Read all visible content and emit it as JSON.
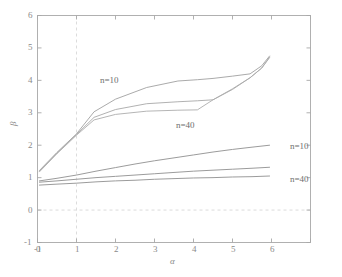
{
  "chart_data": {
    "type": "line",
    "title": "",
    "subtitle": "",
    "xlabel": "α",
    "ylabel": "β",
    "xlim": [
      -1,
      6
    ],
    "ylim": [
      -1,
      6
    ],
    "xticks": [
      -1,
      0,
      1,
      2,
      3,
      4,
      5,
      6
    ],
    "xtick_labels": [
      "-1",
      "0",
      "1",
      "2",
      "3",
      "4",
      "5",
      "6"
    ],
    "yticks": [
      -1,
      0,
      1,
      2,
      3,
      4,
      5,
      6
    ],
    "ytick_labels": [
      "-1",
      "0",
      "1",
      "2",
      "3",
      "4",
      "5",
      "6"
    ],
    "grid": false,
    "legend_position": "inline-annotations",
    "reference_lines": [
      {
        "name": "vertical-zero",
        "axis": "x",
        "value": 0,
        "style": "dashed",
        "color": "#d8d8d8"
      },
      {
        "name": "horizontal-zero",
        "axis": "y",
        "value": 0,
        "style": "dashed",
        "color": "#d8d8d8"
      }
    ],
    "annotations": [
      {
        "text": "n=10",
        "x": 0.6,
        "y": 3.85,
        "group": "upper"
      },
      {
        "text": "n=40",
        "x": 2.55,
        "y": 2.72,
        "group": "upper"
      },
      {
        "text": "n=10",
        "x": 5.2,
        "y": 2.02,
        "group": "lower"
      },
      {
        "text": "n=40",
        "x": 5.2,
        "y": 1.05,
        "group": "lower"
      }
    ],
    "series": [
      {
        "name": "upper-n10",
        "label": "n=10",
        "group": "upper",
        "color": "#a0a0a0",
        "x": [
          -0.95,
          -0.5,
          0.0,
          0.45,
          1.0,
          1.8,
          2.6,
          3.1,
          3.5,
          4.0,
          4.45,
          4.75,
          4.95
        ],
        "y": [
          1.22,
          1.78,
          2.35,
          3.03,
          3.42,
          3.78,
          3.98,
          4.02,
          4.06,
          4.13,
          4.2,
          4.45,
          4.75
        ]
      },
      {
        "name": "upper-n20",
        "label": "n=20",
        "group": "upper",
        "color": "#a8a8a8",
        "x": [
          -0.95,
          -0.5,
          0.0,
          0.45,
          1.0,
          1.8,
          2.6,
          3.1,
          3.5,
          4.0,
          4.45,
          4.75,
          4.95
        ],
        "y": [
          1.2,
          1.76,
          2.33,
          2.86,
          3.1,
          3.28,
          3.34,
          3.37,
          3.4,
          3.72,
          4.08,
          4.38,
          4.72
        ]
      },
      {
        "name": "upper-n40",
        "label": "n=40",
        "group": "upper",
        "color": "#adadad",
        "x": [
          -0.95,
          -0.5,
          0.0,
          0.45,
          1.0,
          1.8,
          2.6,
          3.1,
          3.5,
          4.0,
          4.45,
          4.75,
          4.95
        ],
        "y": [
          1.18,
          1.74,
          2.31,
          2.78,
          2.95,
          3.05,
          3.08,
          3.09,
          3.4,
          3.74,
          4.08,
          4.38,
          4.7
        ]
      },
      {
        "name": "lower-n10",
        "label": "n=10",
        "group": "lower",
        "color": "#909090",
        "x": [
          -0.95,
          -0.5,
          0.0,
          0.5,
          1.0,
          1.5,
          2.0,
          2.5,
          3.0,
          3.5,
          4.0,
          4.5,
          4.95
        ],
        "y": [
          0.9,
          0.98,
          1.08,
          1.2,
          1.31,
          1.42,
          1.52,
          1.61,
          1.7,
          1.79,
          1.87,
          1.94,
          2.0
        ]
      },
      {
        "name": "lower-n20",
        "label": "n=20",
        "group": "lower",
        "color": "#909090",
        "x": [
          -0.95,
          -0.5,
          0.0,
          0.5,
          1.0,
          1.5,
          2.0,
          2.5,
          3.0,
          3.5,
          4.0,
          4.5,
          4.95
        ],
        "y": [
          0.86,
          0.9,
          0.95,
          1.0,
          1.04,
          1.08,
          1.12,
          1.16,
          1.2,
          1.23,
          1.26,
          1.29,
          1.32
        ]
      },
      {
        "name": "lower-n40",
        "label": "n=40",
        "group": "lower",
        "color": "#909090",
        "x": [
          -0.95,
          -0.5,
          0.0,
          0.5,
          1.0,
          1.5,
          2.0,
          2.5,
          3.0,
          3.5,
          4.0,
          4.5,
          4.95
        ],
        "y": [
          0.77,
          0.8,
          0.83,
          0.87,
          0.9,
          0.92,
          0.95,
          0.97,
          0.99,
          1.0,
          1.02,
          1.03,
          1.05
        ]
      }
    ],
    "colors": {
      "axis": "#a8a8a8",
      "tick_text": "#8a8a8a",
      "reference_line": "#d8d8d8",
      "upper_curves": "#a5a5a5",
      "lower_curves": "#909090",
      "background": "#ffffff"
    }
  },
  "axes": {
    "x_title": "α",
    "y_title": "β"
  },
  "xticks": {
    "t0": "-1",
    "t1": "0",
    "t2": "1",
    "t3": "2",
    "t4": "3",
    "t5": "4",
    "t6": "5",
    "t7": "6"
  },
  "yticks": {
    "t0": "-1",
    "t1": "0",
    "t2": "1",
    "t3": "2",
    "t4": "3",
    "t5": "4",
    "t6": "5",
    "t7": "6"
  },
  "annotations": {
    "upper_n10": "n=10",
    "upper_n40": "n=40",
    "lower_n10": "n=10",
    "lower_n40": "n=40"
  }
}
